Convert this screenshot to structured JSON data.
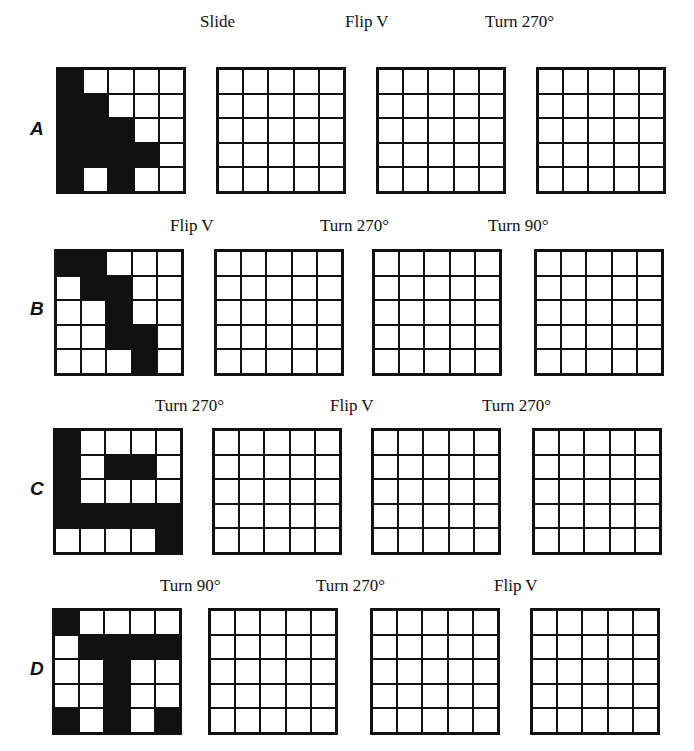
{
  "rows": [
    {
      "letter": "A",
      "start_grid": [
        [
          1,
          0,
          0,
          0,
          0
        ],
        [
          1,
          1,
          0,
          0,
          0
        ],
        [
          1,
          1,
          1,
          0,
          0
        ],
        [
          1,
          1,
          1,
          1,
          0
        ],
        [
          1,
          0,
          1,
          0,
          0
        ]
      ],
      "transforms": [
        "Slide",
        "Flip V",
        "Turn 270°"
      ]
    },
    {
      "letter": "B",
      "start_grid": [
        [
          1,
          1,
          0,
          0,
          0
        ],
        [
          0,
          1,
          1,
          0,
          0
        ],
        [
          0,
          0,
          1,
          0,
          0
        ],
        [
          0,
          0,
          1,
          1,
          0
        ],
        [
          0,
          0,
          0,
          1,
          0
        ]
      ],
      "transforms": [
        "Flip V",
        "Turn 270°",
        "Turn 90°"
      ]
    },
    {
      "letter": "C",
      "start_grid": [
        [
          1,
          0,
          0,
          0,
          0
        ],
        [
          1,
          0,
          1,
          1,
          0
        ],
        [
          1,
          0,
          0,
          0,
          0
        ],
        [
          1,
          1,
          1,
          1,
          1
        ],
        [
          0,
          0,
          0,
          0,
          1
        ]
      ],
      "transforms": [
        "Turn 270°",
        "Flip V",
        "Turn 270°"
      ]
    },
    {
      "letter": "D",
      "start_grid": [
        [
          1,
          0,
          0,
          0,
          0
        ],
        [
          0,
          1,
          1,
          1,
          1
        ],
        [
          0,
          0,
          1,
          0,
          0
        ],
        [
          0,
          0,
          1,
          0,
          0
        ],
        [
          1,
          0,
          1,
          0,
          1
        ]
      ],
      "transforms": [
        "Turn 90°",
        "Turn 270°",
        "Flip V"
      ]
    }
  ]
}
